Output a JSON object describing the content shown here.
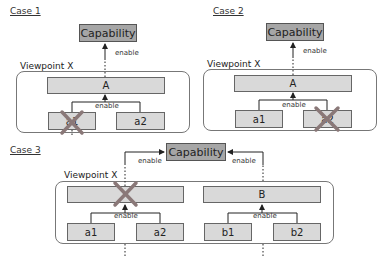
{
  "cases": [
    {
      "label": "Case 1",
      "capability": "Capability",
      "viewpoint": "Viewpoint X",
      "parent": "A",
      "children": [
        "a1",
        "a2"
      ],
      "enable_upper": "enable",
      "enable_lower": "enable",
      "crossed": "a1"
    },
    {
      "label": "Case 2",
      "capability": "Capability",
      "viewpoint": "Viewpoint X",
      "parent": "A",
      "children": [
        "a1",
        "a2"
      ],
      "enable_upper": "enable",
      "enable_lower": "enable",
      "crossed": "a2"
    },
    {
      "label": "Case 3",
      "capability": "Capability",
      "viewpoint": "Viewpoint X",
      "parent_left": "",
      "parent_right": "B",
      "children_left": [
        "a1",
        "a2"
      ],
      "children_right": [
        "b1",
        "b2"
      ],
      "enable_left_upper": "enable",
      "enable_right_upper": "enable",
      "enable_left_lower": "enable",
      "enable_right_lower": "enable",
      "crossed": "left parent"
    }
  ],
  "colors": {
    "capability_fill": "#a6a6a6",
    "box_fill": "#d9d9d9",
    "cross": "#8a7878",
    "line": "#222222"
  }
}
